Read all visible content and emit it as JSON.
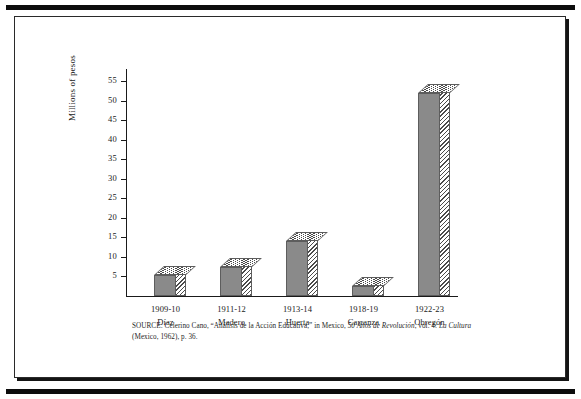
{
  "figure": {
    "source_note_line1_prefix": "SOURCE: Celerino Cano, “Análisis de la Acción Educativa,” in Mexico, ",
    "source_note_italic1": "50 Años de Revolución",
    "source_note_mid": ", vol. 4: ",
    "source_note_italic2": "La Cultura",
    "source_note_end": " (Mexico, 1962), p. 36."
  },
  "chart_data": {
    "type": "bar",
    "title": "",
    "xlabel": "",
    "ylabel": "Millions of pesos",
    "ylim": [
      0,
      55
    ],
    "ytick_step": 5,
    "yticks": [
      55,
      50,
      45,
      40,
      35,
      30,
      25,
      20,
      15,
      10,
      5
    ],
    "grid": false,
    "legend": "none",
    "categories": [
      "1909-10",
      "1911-12",
      "1913-14",
      "1918-19",
      "1922-23"
    ],
    "category_sublabels": [
      "Díaz",
      "Madero",
      "Huerta",
      "Carranza",
      "Obregón"
    ],
    "values": [
      5.5,
      7.5,
      14,
      2.5,
      52
    ],
    "series": [
      {
        "name": "Federal education budget",
        "values": [
          5.5,
          7.5,
          14,
          2.5,
          52
        ]
      }
    ],
    "colors": {
      "bar_face": "#8a8a8a",
      "bar_hatch": "#4a4a4a",
      "axis": "#1a1a1a",
      "text": "#1a1a1a"
    }
  }
}
